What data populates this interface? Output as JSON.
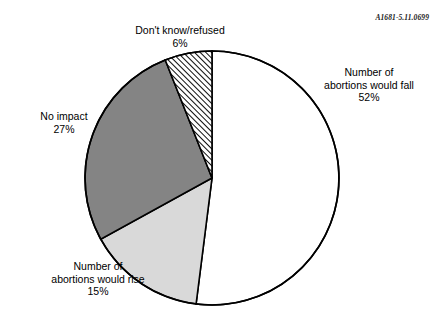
{
  "figure": {
    "id_code": "A1681-5.11.0699"
  },
  "chart_data": {
    "type": "pie",
    "title": "",
    "subtitle": "",
    "xlabel": "",
    "ylabel": "",
    "legend_position": "outside-callout-labels",
    "grid": false,
    "total_percent": 100,
    "start_angle_deg": 0,
    "direction": "clockwise",
    "categories": [
      "Number of abortions would fall",
      "Number of abortions would rise",
      "No impact",
      "Don't know/refused"
    ],
    "values": [
      52,
      15,
      27,
      6
    ],
    "slices": [
      {
        "label_line1": "Number of",
        "label_line2": "abortions would fall",
        "value": 52,
        "value_text": "52%",
        "fill_style": "solid",
        "color": "#ffffff",
        "start_deg": 0,
        "end_deg": 187.2
      },
      {
        "label_line1": "Number of",
        "label_line2": "abortions would rise",
        "value": 15,
        "value_text": "15%",
        "fill_style": "solid",
        "color": "#d9d9d9",
        "start_deg": 187.2,
        "end_deg": 241.2
      },
      {
        "label_line1": "No impact",
        "label_line2": "",
        "value": 27,
        "value_text": "27%",
        "fill_style": "solid",
        "color": "#848484",
        "start_deg": 241.2,
        "end_deg": 338.4
      },
      {
        "label_line1": "Don't know/refused",
        "label_line2": "",
        "value": 6,
        "value_text": "6%",
        "fill_style": "diagonal-hatch",
        "color": "#ffffff",
        "start_deg": 338.4,
        "end_deg": 360
      }
    ],
    "colors": {
      "outline": "#000000",
      "slice_fall": "#ffffff",
      "slice_rise": "#d9d9d9",
      "slice_no_impact": "#848484",
      "slice_dont_know": "#ffffff",
      "hatch_stroke": "#000000",
      "text": "#000000"
    }
  }
}
